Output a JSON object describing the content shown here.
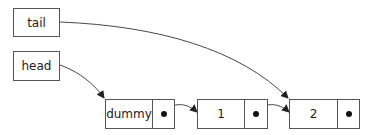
{
  "diagram": {
    "type": "linked-list",
    "variables": [
      {
        "id": "tail",
        "label": "tail",
        "points_to": "node-2"
      },
      {
        "id": "head",
        "label": "head",
        "points_to": "node-dummy"
      }
    ],
    "nodes": [
      {
        "id": "node-dummy",
        "value": "dummy",
        "next": "node-1"
      },
      {
        "id": "node-1",
        "value": "1",
        "next": "node-2"
      },
      {
        "id": "node-2",
        "value": "2",
        "next": null
      }
    ],
    "colors": {
      "stroke": "#555555",
      "text": "#222222",
      "background": "#ffffff"
    }
  }
}
